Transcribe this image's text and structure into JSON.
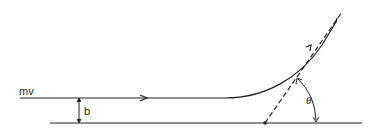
{
  "diagram": {
    "type": "scattering-trajectory",
    "labels": {
      "momentum": "mv",
      "impact_parameter": "b",
      "angle": "θ"
    },
    "colors": {
      "stroke": "#222222",
      "background": "#ffffff"
    }
  }
}
